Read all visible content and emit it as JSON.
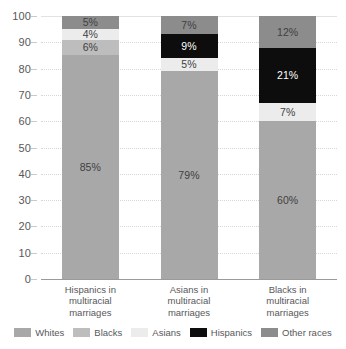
{
  "chart_data": {
    "type": "bar",
    "subtype": "stacked-bar-100",
    "title": "",
    "subtitle": "",
    "xlabel": "",
    "ylabel": "",
    "ylim": [
      0,
      100
    ],
    "yticks": [
      0,
      10,
      20,
      30,
      40,
      50,
      60,
      70,
      80,
      90,
      100
    ],
    "ytick_labels": [
      "0",
      "10",
      "20",
      "30",
      "40",
      "50",
      "60",
      "70",
      "80",
      "90",
      "100"
    ],
    "grid": true,
    "legend_position": "bottom",
    "stack_order_bottom_to_top": [
      "Whites",
      "Blacks",
      "Asians",
      "Hispanics",
      "Other races"
    ],
    "categories": [
      "Hispanics in multiracial marriages",
      "Asians in multiracial marriages",
      "Blacks in multiracial marriages"
    ],
    "category_lines": [
      [
        "Hispanics in",
        "multiracial",
        "marriages"
      ],
      [
        "Asians in",
        "multiracial",
        "marriages"
      ],
      [
        "Blacks in",
        "multiracial",
        "marriages"
      ]
    ],
    "series": [
      {
        "name": "Whites",
        "color": "#a8a8a8",
        "values": [
          85,
          79,
          60
        ],
        "labels": [
          "85%",
          "79%",
          "60%"
        ]
      },
      {
        "name": "Blacks",
        "color": "#bdbdbd",
        "values": [
          6,
          0,
          0
        ],
        "labels": [
          "6%",
          "",
          ""
        ]
      },
      {
        "name": "Asians",
        "color": "#ececec",
        "values": [
          4,
          5,
          7
        ],
        "labels": [
          "4%",
          "5%",
          "7%"
        ]
      },
      {
        "name": "Hispanics",
        "color": "#0d0d0d",
        "values": [
          0,
          9,
          21
        ],
        "labels": [
          "",
          "9%",
          "21%"
        ]
      },
      {
        "name": "Other races",
        "color": "#8c8c8c",
        "values": [
          5,
          7,
          12
        ],
        "labels": [
          "5%",
          "7%",
          "12%"
        ]
      }
    ]
  },
  "legend": {
    "items": [
      {
        "label": "Whites",
        "color": "#a8a8a8"
      },
      {
        "label": "Blacks",
        "color": "#bdbdbd"
      },
      {
        "label": "Asians",
        "color": "#ececec"
      },
      {
        "label": "Hispanics",
        "color": "#0d0d0d"
      },
      {
        "label": "Other races",
        "color": "#8c8c8c"
      }
    ]
  },
  "colors": {
    "axis_text": "#58585a",
    "gridline": "#d6d6d6",
    "baseline": "#9a9a9a",
    "background": "#ffffff",
    "label_dark": "#3f3f41",
    "label_light": "#ffffff"
  }
}
